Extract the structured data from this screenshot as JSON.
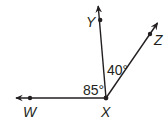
{
  "diagram": {
    "type": "angle-diagram",
    "vertex": {
      "label": "X",
      "x": 106,
      "y": 98
    },
    "rays": [
      {
        "name": "XW",
        "point_label": "W",
        "point": {
          "x": 30,
          "y": 98
        },
        "tip": {
          "x": 14,
          "y": 98
        }
      },
      {
        "name": "XY",
        "point_label": "Y",
        "point": {
          "x": 100,
          "y": 20
        },
        "tip": {
          "x": 98,
          "y": 4
        }
      },
      {
        "name": "XZ",
        "point_label": "Z",
        "point": {
          "x": 150,
          "y": 34
        },
        "tip": {
          "x": 159,
          "y": 21
        }
      }
    ],
    "angles": [
      {
        "name": "angle-WXY",
        "label": "85°"
      },
      {
        "name": "angle-YXZ",
        "label": "40°"
      }
    ],
    "colors": {
      "stroke": "#231f20",
      "background": "#ffffff"
    }
  }
}
